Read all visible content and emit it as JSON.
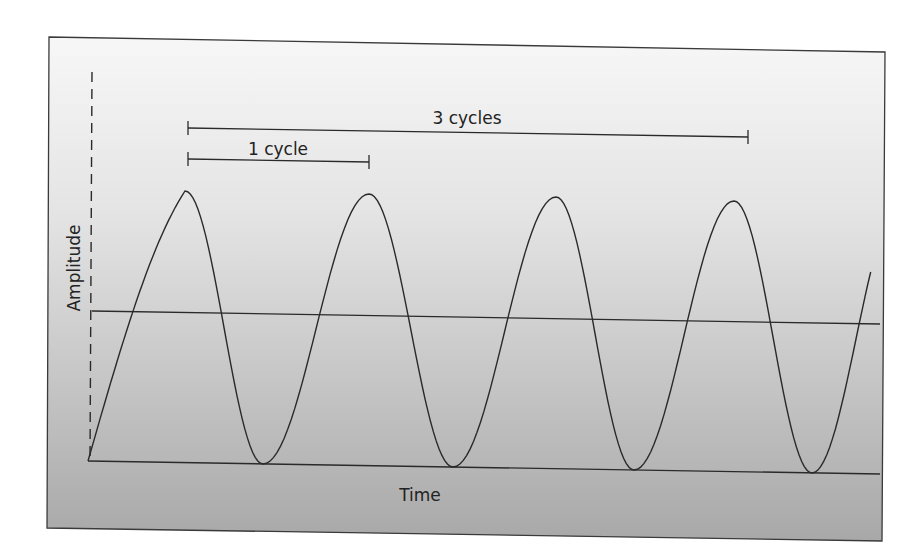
{
  "figure": {
    "title": "",
    "labels": {
      "y_axis": "Amplitude",
      "x_axis": "Time",
      "one_cycle": "1 cycle",
      "three_cycles": "3 cycles"
    },
    "colors": {
      "line": "#2a2a2a",
      "background_top": "#f6f6f6",
      "background_bottom": "#a9a9a9",
      "frame": "#3a3a3a"
    }
  },
  "chart_data": {
    "type": "line",
    "title": "",
    "xlabel": "Time",
    "ylabel": "Amplitude",
    "grid": false,
    "legend": null,
    "series": [
      {
        "name": "wave",
        "peaks_x_cycles": [
          0.5,
          1.5,
          2.5,
          3.5
        ],
        "troughs_x_cycles": [
          1.0,
          2.0,
          3.0,
          4.0
        ],
        "x_range_cycles": [
          0,
          4.5
        ],
        "y_range": [
          -1,
          1
        ]
      }
    ],
    "annotations": [
      {
        "text": "1 cycle",
        "span_cycles": [
          0.5,
          1.5
        ]
      },
      {
        "text": "3 cycles",
        "span_cycles": [
          0.5,
          3.5
        ]
      }
    ],
    "reference_lines": [
      "midline (zero amplitude)",
      "baseline (minimum amplitude)",
      "dashed vertical amplitude axis"
    ]
  }
}
